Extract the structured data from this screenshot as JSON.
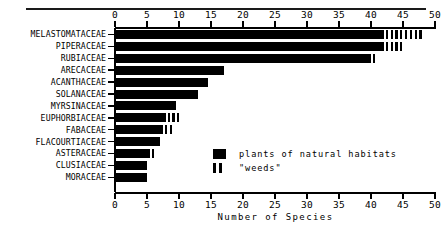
{
  "chart_data": {
    "type": "bar",
    "orientation": "horizontal",
    "title": "",
    "xlabel": "Number of Species",
    "ylabel": "",
    "xlim": [
      0,
      50
    ],
    "xticks": [
      0,
      5,
      10,
      15,
      20,
      25,
      30,
      35,
      40,
      45,
      50
    ],
    "grid": false,
    "axis_top": true,
    "axis_bottom": true,
    "legend_position": "inside-lower-right",
    "categories": [
      "MELASTOMATACEAE",
      "PIPERACEAE",
      "RUBIACEAE",
      "ARECACEAE",
      "ACANTHACEAE",
      "SOLANACEAE",
      "MYRSINACEAE",
      "EUPHORBIACEAE",
      "FABACEAE",
      "FLACOURTIACEAE",
      "ASTERACEAE",
      "CLUSIACEAE",
      "MORACEAE"
    ],
    "series": [
      {
        "name": "plants of natural habitats",
        "style": "solid",
        "values": [
          42,
          42,
          40,
          17,
          14.5,
          13,
          9.5,
          8,
          7.5,
          7,
          5.5,
          5,
          5
        ]
      },
      {
        "name": "\"weeds\"",
        "style": "striped",
        "values": [
          6,
          3,
          1,
          0,
          0,
          0,
          0,
          2,
          1.5,
          0,
          1,
          0,
          0
        ]
      }
    ],
    "totals": [
      48,
      45,
      41,
      17,
      14.5,
      13,
      9.5,
      10,
      9,
      7,
      6.5,
      5,
      5
    ]
  },
  "legend": {
    "entries": [
      {
        "label": "plants of natural habitats",
        "swatch": "solid"
      },
      {
        "label": "\"weeds\"",
        "swatch": "striped"
      }
    ]
  },
  "axis": {
    "x_title": "Number of Species",
    "tick_labels": [
      "0",
      "5",
      "10",
      "15",
      "20",
      "25",
      "30",
      "35",
      "40",
      "45",
      "50"
    ]
  },
  "colors": {
    "bar": "#000000",
    "axis": "#000000",
    "background": "#ffffff"
  }
}
